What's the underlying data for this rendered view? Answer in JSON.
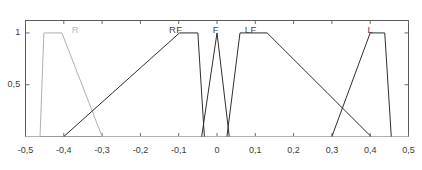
{
  "chart_data": {
    "type": "line",
    "title": "",
    "subtitle": "",
    "xlabel": "",
    "ylabel": "",
    "xlim": [
      -0.5,
      0.5
    ],
    "ylim": [
      0,
      1.12
    ],
    "grid": false,
    "legend_position": "inline-top",
    "x_ticks": [
      -0.5,
      -0.4,
      -0.3,
      -0.2,
      -0.1,
      0,
      0.1,
      0.2,
      0.3,
      0.4,
      0.5
    ],
    "x_tick_labels": [
      "-0,5",
      "-0,4",
      "-0,3",
      "-0,2",
      "-0,1",
      "0",
      "0,1",
      "0,2",
      "0,3",
      "0,4",
      "0,5"
    ],
    "y_ticks": [
      0.5,
      1
    ],
    "y_tick_labels": [
      "0,5",
      "1"
    ],
    "decimal_separator": "comma",
    "series": [
      {
        "name": "R",
        "label": "R",
        "label_x": -0.37,
        "faded": true,
        "color": "#b0b0b0",
        "shape": "trapezoid",
        "points": [
          {
            "x": -0.5,
            "y": 0
          },
          {
            "x": -0.462,
            "y": 0
          },
          {
            "x": -0.452,
            "y": 1
          },
          {
            "x": -0.405,
            "y": 1
          },
          {
            "x": -0.3,
            "y": 0
          },
          {
            "x": 0.5,
            "y": 0
          }
        ]
      },
      {
        "name": "RF",
        "label": "RF",
        "label_x": -0.108,
        "faded": false,
        "color": "#2e2e2e",
        "shape": "trapezoid",
        "points": [
          {
            "x": -0.4,
            "y": 0
          },
          {
            "x": -0.098,
            "y": 1
          },
          {
            "x": -0.05,
            "y": 1
          },
          {
            "x": -0.033,
            "y": 0
          }
        ]
      },
      {
        "name": "F",
        "label": "F",
        "label_x": -0.003,
        "faded": false,
        "color": "#2e2e2e",
        "shape": "triangle",
        "points": [
          {
            "x": -0.04,
            "y": 0
          },
          {
            "x": 0.0,
            "y": 1
          },
          {
            "x": 0.032,
            "y": 0
          }
        ]
      },
      {
        "name": "LF",
        "label": "LF",
        "label_x": 0.088,
        "faded": false,
        "color": "#2e2e2e",
        "shape": "trapezoid",
        "points": [
          {
            "x": 0.026,
            "y": 0
          },
          {
            "x": 0.06,
            "y": 1
          },
          {
            "x": 0.131,
            "y": 1
          },
          {
            "x": 0.402,
            "y": 0
          }
        ]
      },
      {
        "name": "L",
        "label": "L",
        "label_x": 0.4,
        "faded": false,
        "color": "#2e2e2e",
        "shape": "trapezoid",
        "points": [
          {
            "x": 0.3,
            "y": 0
          },
          {
            "x": 0.4,
            "y": 1
          },
          {
            "x": 0.438,
            "y": 1
          },
          {
            "x": 0.455,
            "y": 0
          },
          {
            "x": 0.455,
            "y": 0
          }
        ]
      }
    ]
  },
  "axes": {
    "frame_color": "#5a5a5a",
    "baseline_color": "#6a6a6a",
    "tick_color": "#6a6a6a"
  }
}
